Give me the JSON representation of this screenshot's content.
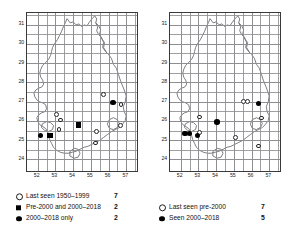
{
  "figure": {
    "type": "distribution-map-pair",
    "panels": [
      {
        "id": "left",
        "axis": {
          "x_ticks": [
            "52",
            "53",
            "54",
            "55",
            "56",
            "57"
          ],
          "y_ticks": [
            "31",
            "30",
            "29",
            "28",
            "27",
            "26",
            "25",
            "24"
          ],
          "xlim": [
            51.4,
            57.6
          ],
          "ylim": [
            23.4,
            31.6
          ]
        },
        "legend": [
          {
            "symbol": "open-circle",
            "label": "Last seen 1950–1999",
            "count": "7"
          },
          {
            "symbol": "filled-square",
            "label": "Pre-2000 and 2000–2018",
            "count": "2"
          },
          {
            "symbol": "filled-circle",
            "label": "2000–2018 only",
            "count": "2"
          }
        ],
        "markers": [
          {
            "symbol": "open-circle",
            "x": 53.05,
            "y": 26.35
          },
          {
            "symbol": "open-circle",
            "x": 53.3,
            "y": 26.05
          },
          {
            "symbol": "open-circle",
            "x": 53.2,
            "y": 25.55
          },
          {
            "symbol": "open-circle",
            "x": 55.3,
            "y": 25.45
          },
          {
            "symbol": "open-circle",
            "x": 55.25,
            "y": 24.85
          },
          {
            "symbol": "open-circle",
            "x": 55.7,
            "y": 27.35
          },
          {
            "symbol": "open-circle",
            "x": 56.7,
            "y": 26.85
          },
          {
            "symbol": "open-circle",
            "x": 56.65,
            "y": 25.75
          },
          {
            "symbol": "filled-square",
            "x": 54.3,
            "y": 25.8
          },
          {
            "symbol": "filled-square",
            "x": 52.7,
            "y": 25.25
          },
          {
            "symbol": "filled-circle",
            "x": 52.15,
            "y": 25.25
          },
          {
            "symbol": "filled-circle",
            "x": 56.25,
            "y": 26.95
          }
        ]
      },
      {
        "id": "right",
        "axis": {
          "x_ticks": [
            "52",
            "53",
            "54",
            "55",
            "56",
            "57"
          ],
          "y_ticks": [
            "31",
            "30",
            "29",
            "28",
            "27",
            "26",
            "25",
            "24"
          ],
          "xlim": [
            51.4,
            57.6
          ],
          "ylim": [
            23.4,
            31.6
          ]
        },
        "legend": [
          {
            "symbol": "open-circle",
            "label": "Last seen pre-2000",
            "count": "7"
          },
          {
            "symbol": "filled-circle",
            "label": "Seen 2000–2018",
            "count": "5"
          }
        ],
        "markers": [
          {
            "symbol": "open-circle",
            "x": 53.05,
            "y": 26.2
          },
          {
            "symbol": "open-circle",
            "x": 53.05,
            "y": 25.4
          },
          {
            "symbol": "open-circle",
            "x": 55.1,
            "y": 25.15
          },
          {
            "symbol": "open-circle",
            "x": 55.55,
            "y": 27.0
          },
          {
            "symbol": "open-circle",
            "x": 55.75,
            "y": 27.0
          },
          {
            "symbol": "open-circle",
            "x": 56.55,
            "y": 26.15
          },
          {
            "symbol": "open-circle",
            "x": 56.4,
            "y": 24.7
          },
          {
            "symbol": "filled-circle",
            "x": 52.25,
            "y": 25.35
          },
          {
            "symbol": "filled-circle",
            "x": 52.5,
            "y": 25.35
          },
          {
            "symbol": "filled-circle",
            "x": 52.95,
            "y": 25.25
          },
          {
            "symbol": "filled-circle",
            "x": 54.05,
            "y": 25.95
          },
          {
            "symbol": "filled-circle",
            "x": 56.4,
            "y": 26.9
          }
        ]
      }
    ],
    "colors": {
      "grid": "#8e8e92",
      "coastline": "#6e6e73",
      "frame": "#3a3a3a",
      "marker": "#000000",
      "background": "#ffffff"
    }
  }
}
